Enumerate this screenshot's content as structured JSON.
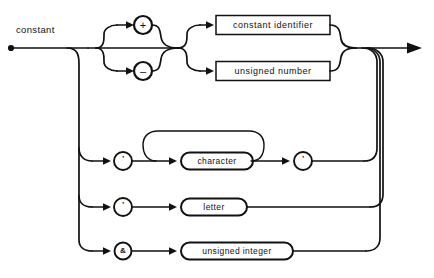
{
  "diagram": {
    "kind": "railroad-syntax-diagram",
    "title": "constant",
    "entry_label": "constant",
    "ink_color": "#111111",
    "background_color": "#ffffff",
    "branches": [
      {
        "id": "signed-value",
        "sign_options": [
          {
            "id": "plus",
            "glyph": "+",
            "shape": "circle"
          },
          {
            "id": "minus",
            "glyph": "–",
            "shape": "circle"
          }
        ],
        "value_options": [
          {
            "id": "constant-identifier",
            "label": "constant identifier",
            "shape": "rect"
          },
          {
            "id": "unsigned-number",
            "label": "unsigned number",
            "shape": "rect"
          }
        ]
      },
      {
        "id": "character-string",
        "open_quote": {
          "id": "quote-open",
          "glyph": "’",
          "shape": "circle"
        },
        "repeat_item": {
          "id": "character",
          "label": "character",
          "shape": "stadium"
        },
        "close_quote": {
          "id": "quote-close",
          "glyph": "’",
          "shape": "circle"
        },
        "has_repeat_loop": true
      },
      {
        "id": "letter-literal",
        "prefix": {
          "id": "letter-prefix",
          "glyph": "’",
          "shape": "circle"
        },
        "item": {
          "id": "letter",
          "label": "letter",
          "shape": "stadium"
        }
      },
      {
        "id": "unsigned-integer-literal",
        "prefix": {
          "id": "integer-prefix",
          "glyph": "&",
          "shape": "circle"
        },
        "item": {
          "id": "unsigned-integer",
          "label": "unsigned integer",
          "shape": "stadium"
        }
      }
    ]
  }
}
